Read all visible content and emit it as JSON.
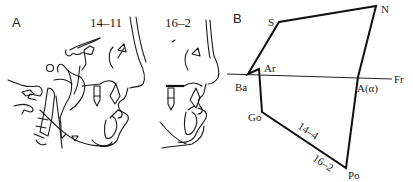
{
  "figure": {
    "panels": [
      {
        "id": "A",
        "label": "A",
        "description": "Lateral cephalometric tracings comparing two time points",
        "tracings": [
          {
            "label": "14–11"
          },
          {
            "label": "16–2"
          }
        ]
      },
      {
        "id": "B",
        "label": "B",
        "description": "Superimposed cephalometric polygon",
        "points": {
          "S": "S",
          "N": "N",
          "Ar": "Ar",
          "Ba": "Ba",
          "Fr": "Fr",
          "A": "A(α)",
          "Go": "Go",
          "Po": "Po"
        },
        "segment_labels": [
          "14–4",
          "16–2"
        ]
      }
    ]
  }
}
